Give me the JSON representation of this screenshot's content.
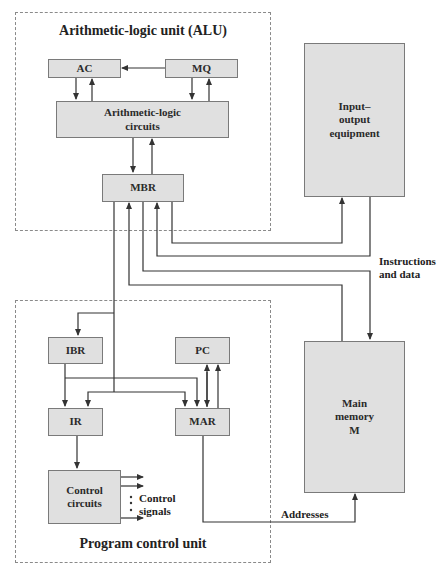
{
  "units": {
    "alu": {
      "title": "Arithmetic-logic unit (ALU)"
    },
    "pcu": {
      "title": "Program control unit"
    }
  },
  "blocks": {
    "ac": "AC",
    "mq": "MQ",
    "alc_line1": "Arithmetic-logic",
    "alc_line2": "circuits",
    "mbr": "MBR",
    "io_line1": "Input–",
    "io_line2": "output",
    "io_line3": "equipment",
    "ibr": "IBR",
    "pc": "PC",
    "ir": "IR",
    "mar": "MAR",
    "cc_line1": "Control",
    "cc_line2": "circuits",
    "mem_line1": "Main",
    "mem_line2": "memory",
    "mem_line3": "M"
  },
  "labels": {
    "instr_line1": "Instructions",
    "instr_line2": "and data",
    "ctrl_line1": "Control",
    "ctrl_line2": "signals",
    "addresses": "Addresses"
  },
  "colors": {
    "box_fill": "#e0e0e0",
    "box_border": "#7a7a7a",
    "line": "#333333",
    "dashed": "#8a8a8a"
  }
}
